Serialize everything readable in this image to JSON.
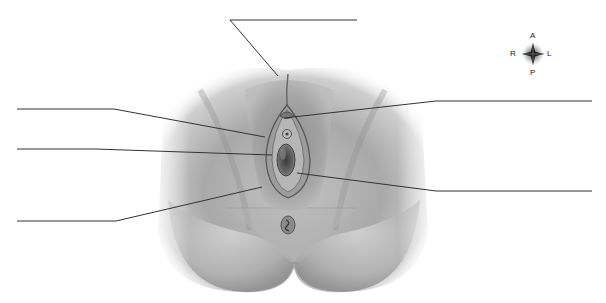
{
  "diagram": {
    "type": "anatomical-labeling",
    "view": "inferior view, external structures",
    "label_count": 6,
    "labels": [
      {
        "id": "label-top",
        "text": "",
        "side": "top",
        "line": {
          "x1": 230,
          "y1": 20,
          "x2": 357,
          "y2": 20
        },
        "target": {
          "x": 278,
          "y": 76
        }
      },
      {
        "id": "label-left-1",
        "text": "",
        "side": "left",
        "line": {
          "x1": 17,
          "y1": 109,
          "x2": 114,
          "y2": 109
        },
        "target": {
          "x": 265,
          "y": 137
        }
      },
      {
        "id": "label-left-2",
        "text": "",
        "side": "left",
        "line": {
          "x1": 17,
          "y1": 149,
          "x2": 95,
          "y2": 149
        },
        "target": {
          "x": 272,
          "y": 155
        }
      },
      {
        "id": "label-left-3",
        "text": "",
        "side": "left",
        "line": {
          "x1": 17,
          "y1": 221,
          "x2": 116,
          "y2": 221
        },
        "target": {
          "x": 262,
          "y": 187
        }
      },
      {
        "id": "label-right-1",
        "text": "",
        "side": "right",
        "line": {
          "x1": 436,
          "y1": 101,
          "x2": 592,
          "y2": 101
        },
        "target": {
          "x": 284,
          "y": 118
        }
      },
      {
        "id": "label-right-2",
        "text": "",
        "side": "right",
        "line": {
          "x1": 436,
          "y1": 191,
          "x2": 592,
          "y2": 191
        },
        "target": {
          "x": 297,
          "y": 173
        }
      }
    ]
  },
  "compass": {
    "top": "A",
    "bottom": "P",
    "left": "R",
    "right": "L"
  },
  "colors": {
    "background": "#ffffff",
    "leader_line": "#333333",
    "skin_light": "#d8d8d8",
    "skin_mid": "#a8a8a8",
    "skin_dark": "#5a5a5a"
  }
}
